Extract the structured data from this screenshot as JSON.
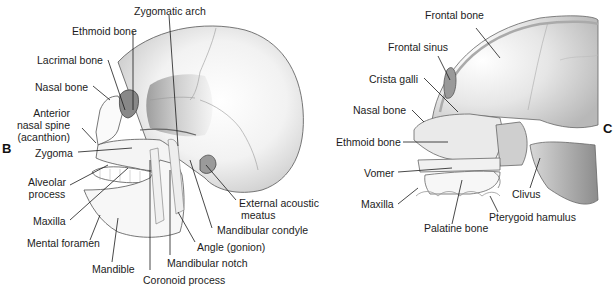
{
  "figure": {
    "panels": [
      {
        "letter": "B",
        "view": "lateral skull",
        "labels": {
          "zygomatic_arch": "Zygomatic arch",
          "ethmoid_bone": "Ethmoid bone",
          "lacrimal_bone": "Lacrimal bone",
          "nasal_bone": "Nasal bone",
          "anterior_nasal_spine_1": "Anterior",
          "anterior_nasal_spine_2": "nasal spine",
          "anterior_nasal_spine_3": "(acanthion)",
          "zygoma": "Zygoma",
          "alveolar_process_1": "Alveolar",
          "alveolar_process_2": "process",
          "maxilla": "Maxilla",
          "mental_foramen": "Mental foramen",
          "mandible": "Mandible",
          "coronoid_process": "Coronoid process",
          "mandibular_notch": "Mandibular notch",
          "angle_gonion": "Angle (gonion)",
          "mandibular_condyle": "Mandibular condyle",
          "external_acoustic_meatus_1": "External acoustic",
          "external_acoustic_meatus_2": "meatus"
        }
      },
      {
        "letter": "C",
        "view": "sagittal section skull",
        "labels": {
          "frontal_bone": "Frontal bone",
          "frontal_sinus": "Frontal sinus",
          "crista_galli": "Crista galli",
          "nasal_bone": "Nasal bone",
          "ethmoid_bone": "Ethmoid bone",
          "vomer": "Vomer",
          "maxilla": "Maxilla",
          "palatine_bone": "Palatine bone",
          "pterygoid_hamulus": "Pterygoid hamulus",
          "clivus": "Clivus"
        }
      }
    ]
  }
}
